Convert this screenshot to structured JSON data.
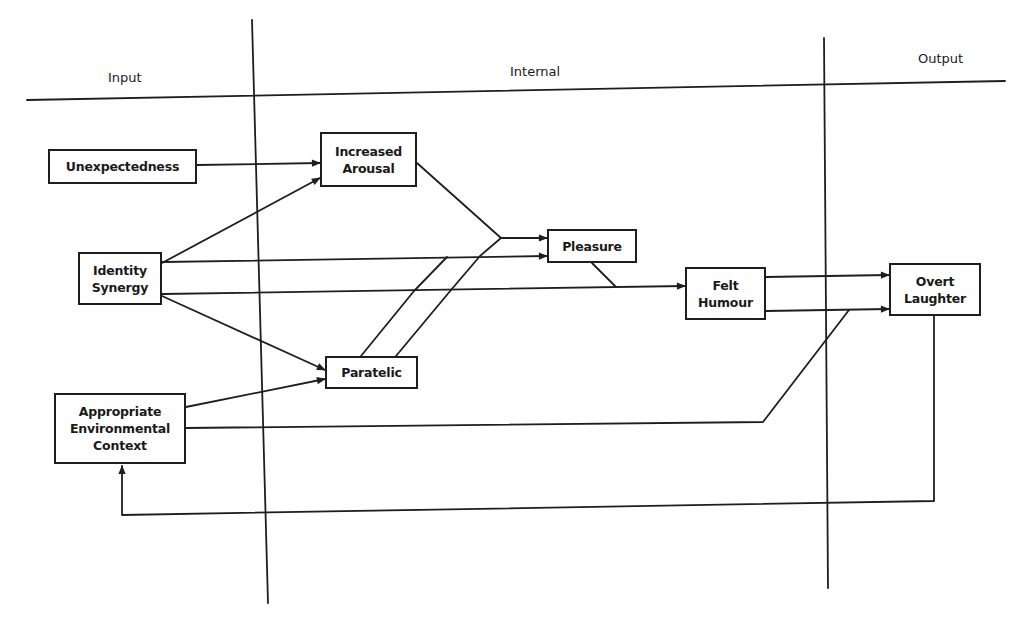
{
  "columns": {
    "input": "Input",
    "internal": "Internal",
    "output": "Output"
  },
  "nodes": {
    "unexpectedness": "Unexpectedness",
    "increased_arousal": "Increased\nArousal",
    "identity_synergy": "Identity\nSynergy",
    "pleasure": "Pleasure",
    "paratelic": "Paratelic",
    "appropriate_context": "Appropriate\nEnvironmental\nContext",
    "felt_humour": "Felt\nHumour",
    "overt_laughter": "Overt\nLaughter"
  },
  "edges": [
    {
      "from": "Unexpectedness",
      "to": "Increased Arousal"
    },
    {
      "from": "Identity Synergy",
      "to": "Increased Arousal"
    },
    {
      "from": "Identity Synergy",
      "to": "Pleasure"
    },
    {
      "from": "Identity Synergy",
      "to": "Felt Humour"
    },
    {
      "from": "Identity Synergy",
      "to": "Paratelic"
    },
    {
      "from": "Increased Arousal",
      "to": "Pleasure",
      "via": "junction with Paratelic"
    },
    {
      "from": "Paratelic",
      "to": "Pleasure"
    },
    {
      "from": "Pleasure",
      "to": "Felt Humour",
      "via": "junction"
    },
    {
      "from": "Appropriate Environmental Context",
      "to": "Paratelic"
    },
    {
      "from": "Appropriate Environmental Context",
      "to": "Overt Laughter",
      "via": "junction with Felt Humour"
    },
    {
      "from": "Felt Humour",
      "to": "Overt Laughter"
    },
    {
      "from": "Overt Laughter",
      "to": "Appropriate Environmental Context",
      "type": "feedback"
    }
  ]
}
